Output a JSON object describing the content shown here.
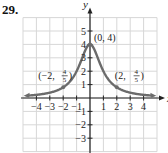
{
  "problem_number": "29.",
  "chart_data": {
    "type": "line",
    "title": "",
    "xlabel": "x",
    "ylabel": "y",
    "xlim": [
      -5,
      5
    ],
    "ylim": [
      -4,
      6
    ],
    "grid": true,
    "x_ticks": [
      -4,
      -3,
      -2,
      -1,
      1,
      2,
      3,
      4
    ],
    "y_ticks": [
      -3,
      -2,
      -1,
      1,
      2,
      3,
      4,
      5
    ],
    "x_tick_labels": [
      "−4",
      "−3",
      "−2",
      "−1",
      "1",
      "2",
      "3",
      "4"
    ],
    "y_tick_labels": [
      "−3",
      "−2",
      "−1",
      "1",
      "2",
      "3",
      "4",
      "5"
    ],
    "series": [
      {
        "name": "y = 4/(x²+1)",
        "color": "#6b6b6b",
        "x": [
          -4.8,
          -4,
          -3,
          -2,
          -1,
          -0.5,
          0,
          0.5,
          1,
          2,
          3,
          4,
          4.8
        ],
        "y": [
          0.166,
          0.235,
          0.4,
          0.8,
          2,
          3.2,
          4,
          3.2,
          2,
          0.8,
          0.4,
          0.235,
          0.166
        ]
      }
    ],
    "annotations": [
      {
        "text": "(0, 4)",
        "x": 0,
        "y": 4
      },
      {
        "text": "(−2, 4/5)",
        "x": -2,
        "y": 0.8
      },
      {
        "text": "(2, 4/5)",
        "x": 2,
        "y": 0.8
      }
    ],
    "labeled_points": [
      [
        0,
        4
      ],
      [
        -2,
        0.8
      ],
      [
        2,
        0.8
      ]
    ]
  }
}
